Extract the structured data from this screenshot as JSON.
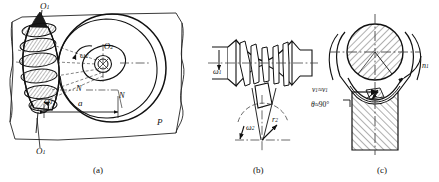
{
  "figure": {
    "panels": [
      {
        "id": "a",
        "caption": "(a)",
        "name": "globoid-worm-and-wheel-plan-view",
        "labels": [
          {
            "key": "O1_top",
            "text": "O",
            "sub": "1",
            "name": "worm-axis-label-top"
          },
          {
            "key": "O1_bottom",
            "text": "O",
            "sub": "1",
            "name": "worm-axis-label-bottom"
          },
          {
            "key": "O2",
            "text": "O",
            "sub": "2",
            "name": "wheel-center-label"
          },
          {
            "key": "w1",
            "text": "ω",
            "sub": "1",
            "name": "worm-angular-velocity-label"
          },
          {
            "key": "w2",
            "text": "ω",
            "sub": "2",
            "name": "wheel-angular-velocity-label"
          },
          {
            "key": "N_left",
            "text": "N",
            "sub": "",
            "name": "section-line-label-left"
          },
          {
            "key": "N_right",
            "text": "N",
            "sub": "",
            "name": "section-line-label-right"
          },
          {
            "key": "a",
            "text": "a",
            "sub": "",
            "name": "center-distance-label"
          },
          {
            "key": "P",
            "text": "P",
            "sub": "",
            "name": "plane-label"
          }
        ]
      },
      {
        "id": "b",
        "caption": "(b)",
        "name": "worm-elevation-and-wheel-section",
        "labels": [
          {
            "key": "w1",
            "text": "ω",
            "sub": "1",
            "name": "worm-angular-velocity-label"
          },
          {
            "key": "w2",
            "text": "ω",
            "sub": "2",
            "name": "wheel-angular-velocity-label"
          },
          {
            "key": "r2",
            "text": "r",
            "sub": "2",
            "name": "wheel-pitch-radius-label"
          }
        ]
      },
      {
        "id": "c",
        "caption": "(c)",
        "name": "mesh-contact-section-velocities",
        "labels": [
          {
            "key": "vs",
            "text": "v",
            "sub": "1",
            "relation": "≈",
            "text2": "v",
            "sub2": "1",
            "name": "sliding-velocity-label"
          },
          {
            "key": "theta",
            "text": "θ",
            "relation": "≈",
            "value": "90°",
            "name": "contact-angle-label"
          },
          {
            "key": "n1",
            "text": "n",
            "sub": "1",
            "name": "worm-rotation-direction-label"
          }
        ]
      }
    ]
  },
  "text": {
    "cap_a": "(a)",
    "cap_b": "(b)",
    "cap_c": "(c)",
    "O": "O",
    "N": "N",
    "P": "P",
    "a": "a",
    "omega": "ω",
    "r": "r",
    "v": "v",
    "n": "n",
    "theta": "θ",
    "approx": "≈",
    "deg90": "90°",
    "one": "1",
    "two": "2"
  },
  "colors": {
    "ink": "#111111",
    "paper": "#ffffff",
    "hatch": "#1a1a1a"
  }
}
